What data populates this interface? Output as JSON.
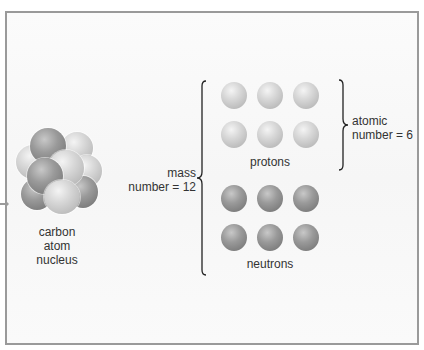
{
  "nucleus": {
    "label_lines": [
      "carbon",
      "atom",
      "nucleus"
    ]
  },
  "protons": {
    "label": "protons",
    "count": 6,
    "color": "#d4d4d4"
  },
  "neutrons": {
    "label": "neutrons",
    "count": 6,
    "color": "#8e8e8e"
  },
  "mass_number": {
    "line1": "mass",
    "line2": "number = 12"
  },
  "atomic_number": {
    "line1": "atomic",
    "line2": "number = 6"
  },
  "colors": {
    "frame_border": "#9a9a9a",
    "text": "#333333"
  }
}
